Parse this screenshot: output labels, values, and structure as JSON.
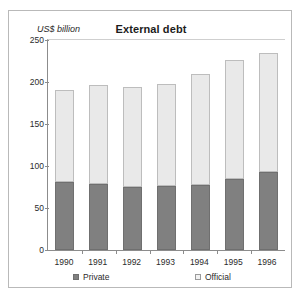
{
  "figure": {
    "title": "External debt",
    "y_unit_label": "US$ billion"
  },
  "legend": {
    "private_label": "Private",
    "official_label": "Official",
    "private_color": "#808080",
    "official_color": "#e9e9e9"
  },
  "chart_data": {
    "type": "bar",
    "stacked": true,
    "title": "External debt",
    "xlabel": "",
    "ylabel": "US$ billion",
    "ylim": [
      0,
      250
    ],
    "yticks": [
      0,
      50,
      100,
      150,
      200,
      250
    ],
    "grid": false,
    "legend_position": "bottom",
    "categories": [
      "1990",
      "1991",
      "1992",
      "1993",
      "1994",
      "1995",
      "1996"
    ],
    "series": [
      {
        "name": "Private",
        "color": "#808080",
        "values": [
          81,
          79,
          75,
          76,
          77,
          85,
          93
        ]
      },
      {
        "name": "Official",
        "color": "#e9e9e9",
        "values": [
          110,
          117,
          119,
          122,
          133,
          141,
          142
        ]
      }
    ],
    "totals": [
      191,
      196,
      194,
      198,
      210,
      226,
      235
    ]
  }
}
